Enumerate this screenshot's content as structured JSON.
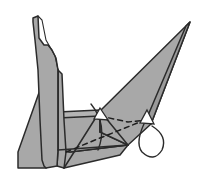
{
  "figure": {
    "kind": "origami-fold-diagram",
    "background_color": "#ffffff",
    "paper_fill": "#a8a8a8",
    "paper_fill_light": "#b4b4b4",
    "paper_fill_dark": "#9a9a9a",
    "line_color": "#2b2b2b",
    "dashed_fold_color": "#1e1e1e",
    "canvas": {
      "width": 198,
      "height": 182
    }
  },
  "shapes": {
    "left_panel": {
      "name": "left-vertical-flap",
      "fill": "#a8a8a8",
      "points": "33,18 38,16 39,38 44,45 48,45 52,50 56,58 58,70 58,150 57,166 46,168 44,166 42,160 40,120 38,70 35,40 33,22"
    },
    "left_panel_inner": {
      "name": "left-flap-inner-crease",
      "points": "38,16 42,20 46,40 50,47 55,56 58,70 58,150"
    },
    "left_lower_band": {
      "name": "left-lower-band",
      "fill": "#a8a8a8",
      "points": "58,150 58,70 62,74 64,120 66,152 64,168 57,166"
    },
    "bottom_left_wedge": {
      "name": "bottom-left-wedge",
      "fill": "#a8a8a8",
      "points": "58,70 58,150 46,168 18,168 18,152 52,56"
    },
    "horizontal_band": {
      "name": "horizontal-fold-band",
      "fill": "#b4b4b4",
      "points": "58,112 100,110 100,116 58,118"
    },
    "main_wing": {
      "name": "main-wing-triangle",
      "fill": "#a8a8a8",
      "points": "100,111 190,22 151,124 128,145 100,132"
    },
    "wing_sliver": {
      "name": "wing-edge-sliver",
      "fill": "#9a9a9a",
      "points": "190,22 151,124 146,120 186,26"
    },
    "lower_triangle": {
      "name": "lower-body-triangle",
      "fill": "#a8a8a8",
      "points": "100,111 100,132 128,145 70,152 58,150 58,118"
    },
    "bottom_flap": {
      "name": "bottom-flap",
      "fill": "#a8a8a8",
      "points": "58,150 70,152 128,145 120,155 64,168"
    }
  },
  "creases": {
    "dashed_main": {
      "name": "valley-fold-dashed-line",
      "path": "M 66,152 L 100,138 L 145,120"
    },
    "dashed_upper": {
      "name": "valley-fold-dashed-upper",
      "path": "M 100,116 L 128,122 L 146,120"
    },
    "solid_diag_a": {
      "name": "crease-diagonal-a",
      "path": "M 100,111 L 64,168"
    },
    "solid_diag_b": {
      "name": "crease-diagonal-b",
      "path": "M 100,111 L 100,132"
    },
    "solid_diag_c": {
      "name": "crease-diagonal-c",
      "path": "M 128,145 L 100,111"
    },
    "solid_diag_d": {
      "name": "crease-diagonal-d",
      "path": "M 58,150 L 128,145"
    },
    "curve_center": {
      "name": "center-rotation-curve",
      "path": "M 91,104 Q 108,125 98,150"
    }
  },
  "arrows": {
    "fold_arrow": {
      "name": "fold-direction-arrow",
      "curve": "M 152,126 Q 168,136 162,150 Q 154,163 142,152 Q 134,142 147,118",
      "head": "147,110 154,124 140,123"
    },
    "center_arrow": {
      "name": "center-fold-arrow",
      "head": "100,108 108,120 94,119"
    }
  }
}
